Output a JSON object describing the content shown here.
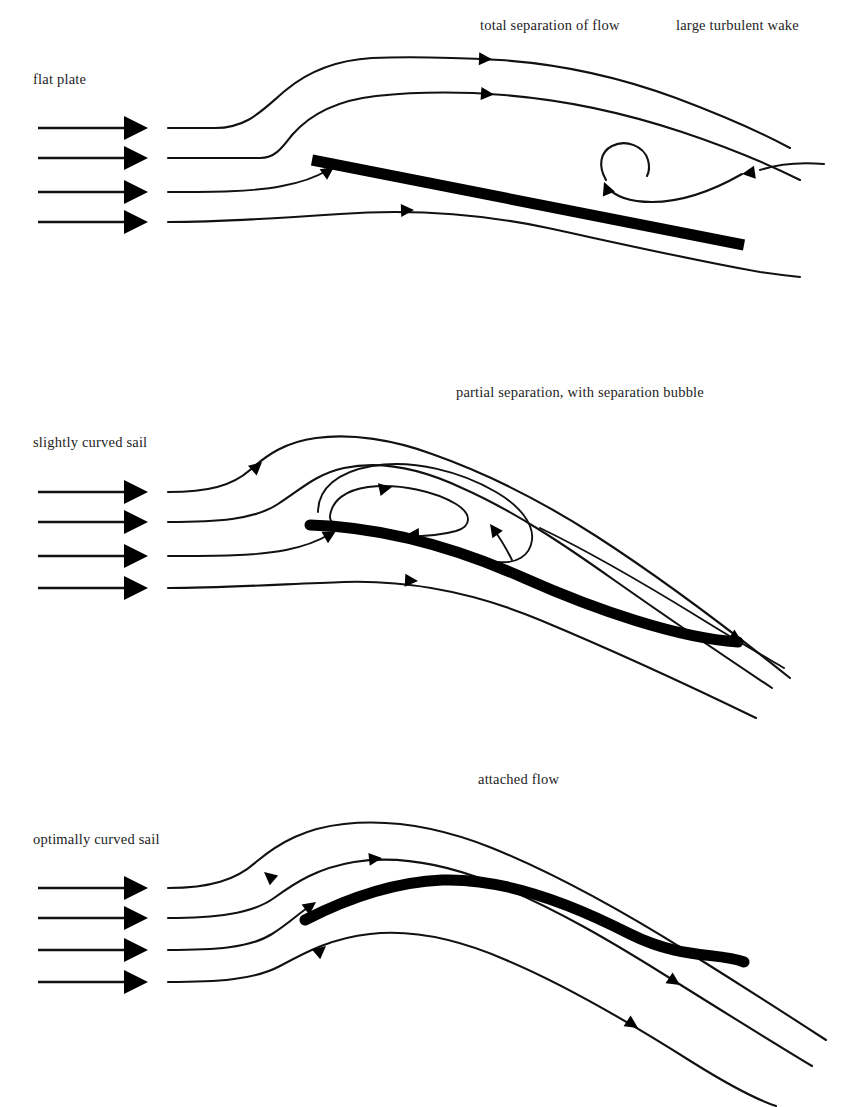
{
  "figure": {
    "width": 858,
    "height": 1107,
    "background": "#ffffff",
    "ink": "#111111"
  },
  "panels": [
    {
      "id": "flat-plate",
      "left_label": "flat plate",
      "top_labels": [
        "total separation of flow",
        "large turbulent wake"
      ],
      "inlet_arrow_count": 4,
      "regime": "total separation",
      "foil_type": "straight flat plate",
      "has_vortex": true,
      "has_bubble": false
    },
    {
      "id": "slightly-curved-sail",
      "left_label": "slightly curved sail",
      "top_labels": [
        "partial separation, with separation bubble"
      ],
      "inlet_arrow_count": 4,
      "regime": "partial separation",
      "foil_type": "slightly cambered arc",
      "has_vortex": false,
      "has_bubble": true
    },
    {
      "id": "optimally-curved-sail",
      "left_label": "optimally curved sail",
      "top_labels": [
        "attached flow"
      ],
      "inlet_arrow_count": 4,
      "regime": "attached flow",
      "foil_type": "optimally cambered arc",
      "has_vortex": false,
      "has_bubble": false
    }
  ],
  "labels": {
    "total_separation": "total separation of flow",
    "turbulent_wake": "large turbulent wake",
    "flat_plate": "flat plate",
    "partial_separation": "partial separation, with separation bubble",
    "slightly_curved_sail": "slightly curved sail",
    "attached_flow": "attached flow",
    "optimally_curved_sail": "optimally curved sail"
  }
}
